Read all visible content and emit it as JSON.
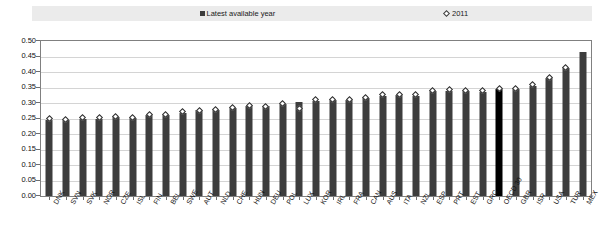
{
  "legend": {
    "latest_label": "Latest available year",
    "year_label": "2011",
    "latest_marker": "filled-square-marker",
    "year_marker": "open-diamond-marker"
  },
  "axis": {
    "y_ticks": [
      "0.50",
      "0.45",
      "0.40",
      "0.35",
      "0.30",
      "0.25",
      "0.20",
      "0.15",
      "0.10",
      "0.05",
      "0.00"
    ]
  },
  "colors": {
    "bar": "#3d3d3d",
    "bar_highlight": "#000000",
    "marker_fill": "#ffffff",
    "marker_stroke": "#2b2b2b",
    "gridline": "#d4d4d4",
    "frame": "#808080",
    "legend_band": "#ebebeb"
  },
  "chart_data": {
    "type": "bar",
    "title": "",
    "xlabel": "",
    "ylabel": "",
    "ylim": [
      0.0,
      0.5
    ],
    "ytick_step": 0.05,
    "grid": true,
    "legend_position": "top",
    "highlight_category": "OECD 30",
    "categories": [
      "DNK",
      "SVN",
      "SVK",
      "NOR",
      "CZE",
      "ISL",
      "FIN",
      "BEL",
      "SWE",
      "AUT",
      "NLD",
      "CHE",
      "HUN",
      "DEU",
      "POL",
      "LUX",
      "KOR",
      "IRL",
      "FRA",
      "CAN",
      "AUS",
      "ITA",
      "NZL",
      "ESP",
      "PRT",
      "EST",
      "GRC",
      "OECD 30",
      "GBR",
      "ISR",
      "USA",
      "TUR",
      "MEX"
    ],
    "series": [
      {
        "name": "Latest available year",
        "marker": "filled-square-marker",
        "values": [
          0.245,
          0.246,
          0.25,
          0.25,
          0.256,
          0.251,
          0.26,
          0.262,
          0.269,
          0.276,
          0.278,
          0.285,
          0.289,
          0.289,
          0.298,
          0.302,
          0.307,
          0.31,
          0.309,
          0.316,
          0.323,
          0.327,
          0.324,
          0.338,
          0.338,
          0.338,
          0.337,
          0.345,
          0.345,
          0.356,
          0.38,
          0.412,
          0.466
        ]
      },
      {
        "name": "2011",
        "marker": "open-diamond-marker",
        "values": [
          0.249,
          0.247,
          0.252,
          0.253,
          0.257,
          0.252,
          0.262,
          0.264,
          0.271,
          0.277,
          0.28,
          0.287,
          0.291,
          0.29,
          0.3,
          0.282,
          0.31,
          0.312,
          0.311,
          0.317,
          0.326,
          0.328,
          0.326,
          0.341,
          0.342,
          0.34,
          0.339,
          0.348,
          0.348,
          0.359,
          0.383,
          0.415,
          null
        ]
      }
    ]
  }
}
